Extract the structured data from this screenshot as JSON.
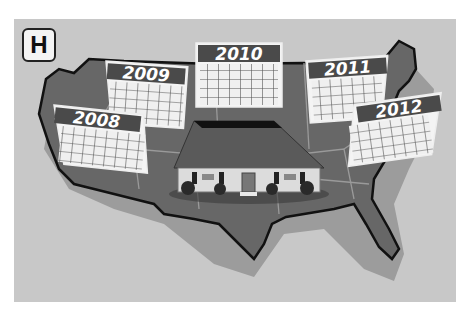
{
  "panel": {
    "label": "H"
  },
  "illustration": {
    "subject": "us-map-with-house-and-calendars",
    "calendars": [
      {
        "year": "2008"
      },
      {
        "year": "2009"
      },
      {
        "year": "2010"
      },
      {
        "year": "2011"
      },
      {
        "year": "2012"
      }
    ]
  },
  "colors": {
    "background": "#c8c8c8",
    "map_fill": "#666666",
    "map_shadow": "#9a9a9a",
    "calendar_header": "#4a4a4a",
    "calendar_grid": "#f2f2f2",
    "house_roof": "#5a5a5a",
    "house_wall": "#dcdcdc"
  }
}
